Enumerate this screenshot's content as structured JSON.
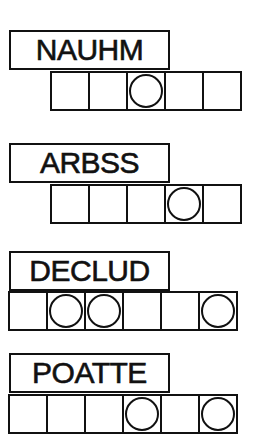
{
  "puzzles": [
    {
      "scrambled": "NAUHM",
      "letters": 5,
      "circled": [
        3
      ],
      "label_top": 30,
      "grid_top": 71,
      "grid_left": 50
    },
    {
      "scrambled": "ARBSS",
      "letters": 5,
      "circled": [
        4
      ],
      "label_top": 143,
      "grid_top": 184,
      "grid_left": 50
    },
    {
      "scrambled": "DECLUD",
      "letters": 6,
      "circled": [
        2,
        3,
        6
      ],
      "label_top": 251,
      "grid_top": 291,
      "grid_left": 8
    },
    {
      "scrambled": "POATTE",
      "letters": 6,
      "circled": [
        4,
        6
      ],
      "label_top": 353,
      "grid_top": 394,
      "grid_left": 8
    }
  ],
  "colors": {
    "ink": "#111111",
    "paper": "#ffffff"
  }
}
